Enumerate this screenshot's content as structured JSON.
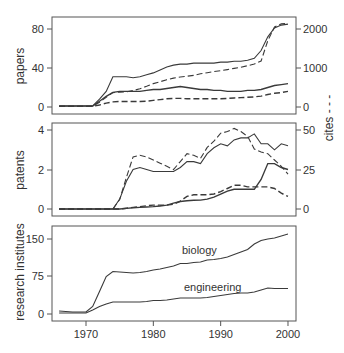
{
  "chart_data": [
    {
      "type": "line",
      "panel": "top",
      "ylabel": "papers",
      "ylabel_right": "cites - - -",
      "yticks": [
        0,
        40,
        80
      ],
      "yticks_right": [
        0,
        1000,
        2000
      ],
      "ylim": [
        0,
        85
      ],
      "ylim_right": [
        0,
        2125
      ],
      "x": [
        1966,
        1967,
        1968,
        1969,
        1970,
        1971,
        1972,
        1973,
        1974,
        1975,
        1976,
        1977,
        1978,
        1979,
        1980,
        1981,
        1982,
        1983,
        1984,
        1985,
        1986,
        1987,
        1988,
        1989,
        1990,
        1991,
        1992,
        1993,
        1994,
        1995,
        1996,
        1997,
        1998,
        1999,
        2000
      ],
      "series": [
        {
          "name": "papers biology",
          "style": "solid",
          "axis": "left",
          "values": [
            1,
            1,
            1,
            1,
            1,
            1,
            8,
            16,
            31,
            31,
            31,
            30,
            31,
            33,
            35,
            38,
            41,
            43,
            44,
            44,
            45,
            45,
            45,
            45,
            46,
            46,
            47,
            47,
            48,
            50,
            58,
            72,
            81,
            84,
            85
          ]
        },
        {
          "name": "papers engineering",
          "style": "solid",
          "axis": "left",
          "values": [
            1,
            1,
            1,
            1,
            1,
            1,
            6,
            11,
            15,
            16,
            16,
            16,
            16,
            17,
            18,
            18,
            19,
            20,
            21,
            20,
            19,
            18,
            18,
            17,
            17,
            16,
            16,
            16,
            17,
            17,
            18,
            20,
            22,
            23,
            24
          ]
        },
        {
          "name": "cites biology",
          "style": "dashed",
          "axis": "right",
          "values": [
            20,
            20,
            20,
            20,
            20,
            20,
            120,
            250,
            370,
            380,
            390,
            420,
            470,
            530,
            600,
            650,
            700,
            740,
            770,
            790,
            810,
            850,
            880,
            910,
            930,
            960,
            990,
            1020,
            1060,
            1100,
            1180,
            1700,
            2050,
            2130,
            2150
          ]
        },
        {
          "name": "cites engineering",
          "style": "dashed",
          "axis": "right",
          "values": [
            15,
            15,
            15,
            15,
            15,
            15,
            50,
            100,
            130,
            140,
            140,
            140,
            140,
            150,
            170,
            190,
            210,
            220,
            220,
            210,
            210,
            210,
            210,
            210,
            210,
            220,
            230,
            240,
            250,
            260,
            280,
            320,
            350,
            370,
            400
          ]
        }
      ]
    },
    {
      "type": "line",
      "panel": "middle",
      "ylabel": "patents",
      "ylabel_right": "cites - - -",
      "yticks": [
        0,
        2,
        4
      ],
      "yticks_right": [
        0,
        25,
        50
      ],
      "ylim": [
        0,
        4.1
      ],
      "ylim_right": [
        0,
        51.25
      ],
      "x": [
        1966,
        1967,
        1968,
        1969,
        1970,
        1971,
        1972,
        1973,
        1974,
        1975,
        1976,
        1977,
        1978,
        1979,
        1980,
        1981,
        1982,
        1983,
        1984,
        1985,
        1986,
        1987,
        1988,
        1989,
        1990,
        1991,
        1992,
        1993,
        1994,
        1995,
        1996,
        1997,
        1998,
        1999,
        2000
      ],
      "series": [
        {
          "name": "patents biology",
          "style": "solid",
          "axis": "left",
          "values": [
            0,
            0,
            0,
            0,
            0,
            0,
            0,
            0,
            0,
            0.5,
            1.4,
            2.0,
            2.1,
            2.0,
            1.9,
            1.9,
            1.9,
            1.9,
            2.1,
            2.4,
            2.4,
            2.3,
            2.8,
            3.1,
            3.3,
            3.2,
            3.5,
            3.6,
            3.6,
            3.8,
            3.3,
            3.3,
            3.0,
            3.3,
            3.2,
            3.0
          ]
        },
        {
          "name": "patents engineering",
          "style": "solid",
          "axis": "left",
          "values": [
            0,
            0,
            0,
            0,
            0,
            0,
            0,
            0,
            0,
            0,
            0.03,
            0.06,
            0.08,
            0.1,
            0.12,
            0.15,
            0.2,
            0.3,
            0.38,
            0.42,
            0.44,
            0.45,
            0.5,
            0.6,
            0.75,
            0.9,
            1.0,
            1.0,
            1.0,
            1.0,
            1.5,
            2.3,
            2.3,
            2.1,
            2.0
          ]
        },
        {
          "name": "cites biology",
          "style": "dashed",
          "axis": "right",
          "values": [
            0,
            0,
            0,
            0,
            0,
            0,
            0,
            0,
            0,
            6,
            20,
            33,
            34,
            33,
            31,
            29,
            27,
            25,
            30,
            35,
            34,
            32,
            39,
            43,
            48,
            49,
            51,
            49,
            46,
            38,
            36,
            35,
            31,
            27,
            22
          ]
        },
        {
          "name": "cites engineering",
          "style": "dashed",
          "axis": "right",
          "values": [
            0,
            0,
            0,
            0,
            0,
            0,
            0,
            0,
            0,
            0,
            0.5,
            1,
            1.5,
            2,
            2.5,
            2.5,
            2.5,
            3,
            5,
            8,
            9,
            9,
            9,
            9.5,
            11,
            13,
            15,
            15,
            14,
            14,
            14,
            14,
            13,
            10,
            8
          ]
        }
      ]
    },
    {
      "type": "line",
      "panel": "bottom",
      "ylabel": "research institutes",
      "yticks": [
        0,
        75,
        150
      ],
      "ylim": [
        -8,
        160
      ],
      "xlabel": "",
      "xticks": [
        1970,
        1980,
        1990,
        2000
      ],
      "xlim": [
        1965,
        2001
      ],
      "x": [
        1966,
        1967,
        1968,
        1969,
        1970,
        1971,
        1972,
        1973,
        1974,
        1975,
        1976,
        1977,
        1978,
        1979,
        1980,
        1981,
        1982,
        1983,
        1984,
        1985,
        1986,
        1987,
        1988,
        1989,
        1990,
        1991,
        1992,
        1993,
        1994,
        1995,
        1996,
        1997,
        1998,
        1999,
        2000
      ],
      "series": [
        {
          "name": "biology",
          "style": "solid",
          "values": [
            6,
            5,
            4,
            4,
            4,
            15,
            45,
            75,
            85,
            84,
            83,
            82,
            83,
            85,
            88,
            90,
            93,
            96,
            101,
            101,
            103,
            104,
            108,
            109,
            111,
            114,
            119,
            124,
            129,
            140,
            147,
            150,
            152,
            156,
            160
          ]
        },
        {
          "name": "engineering",
          "style": "solid",
          "values": [
            2,
            2,
            2,
            2,
            2,
            8,
            15,
            20,
            24,
            24,
            24,
            24,
            24,
            25,
            27,
            27,
            28,
            30,
            32,
            32,
            32,
            32,
            33,
            35,
            37,
            39,
            41,
            42,
            42,
            44,
            48,
            52,
            51,
            51,
            51
          ]
        }
      ],
      "annotations": [
        "biology",
        "engineering"
      ]
    }
  ],
  "labels": {
    "panel1_ylabel": "papers",
    "panel2_ylabel": "patents",
    "panel3_ylabel": "research institutes",
    "right_ylabel": "cites - - -",
    "annot_biology": "biology",
    "annot_engineering": "engineering",
    "xticks": [
      "1970",
      "1980",
      "1990",
      "2000"
    ],
    "p1_left_ticks": [
      "0",
      "40",
      "80"
    ],
    "p1_right_ticks": [
      "0",
      "1000",
      "2000"
    ],
    "p2_left_ticks": [
      "0",
      "2",
      "4"
    ],
    "p2_right_ticks": [
      "0",
      "25",
      "50"
    ],
    "p3_left_ticks": [
      "0",
      "75",
      "150"
    ]
  },
  "colors": {
    "line": "#3a3a3a",
    "frame": "#555555",
    "text": "#333333"
  }
}
